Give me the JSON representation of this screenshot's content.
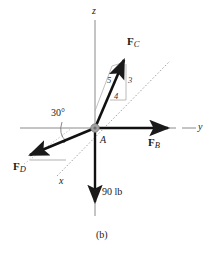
{
  "figure": {
    "caption": "(b)",
    "origin_point_label": "A",
    "weight_label": "90 lb",
    "angle_label": "30°",
    "axes": [
      {
        "name": "z",
        "label": "z",
        "direction": "vertical-up"
      },
      {
        "name": "y",
        "label": "y",
        "direction": "horizontal-right"
      },
      {
        "name": "x",
        "label": "x",
        "direction": "diagonal-lower-left"
      }
    ],
    "forces": [
      {
        "name": "F_C",
        "bold": "F",
        "sub": "C",
        "description": "force toward upper right in x-z plane"
      },
      {
        "name": "F_B",
        "bold": "F",
        "sub": "B",
        "description": "force along positive y axis"
      },
      {
        "name": "F_D",
        "bold": "F",
        "sub": "D",
        "description": "force toward lower left at 30 degrees"
      }
    ],
    "slope_triangle": {
      "hypotenuse": "5",
      "vertical": "3",
      "horizontal": "4"
    },
    "colors": {
      "axis": "#8a8a8a",
      "vector": "#1a1a1a",
      "helper": "#a8a8a8",
      "text": "#1a1a1a",
      "node": "#9a9a9a",
      "background": "#ffffff"
    }
  }
}
